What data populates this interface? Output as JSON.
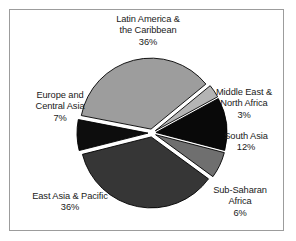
{
  "chart_data": {
    "type": "pie",
    "title": "",
    "subtitle": "",
    "xlabel": "",
    "ylabel": "",
    "legend_position": "none",
    "grid": false,
    "exploded": true,
    "value_unit": "%",
    "total": 100,
    "center": {
      "x": 152,
      "y": 133
    },
    "radius": 71,
    "explode_offset": 4,
    "slices": [
      {
        "label": "Latin America &\nthe Caribbean",
        "label_line1": "Latin America &",
        "label_line2": "the Caribbean",
        "value": 36,
        "value_text": "36%",
        "color": "#9d9d9d",
        "start_angle": 281,
        "end_angle": 410.6
      },
      {
        "label": "Middle East &\nNorth Africa",
        "label_line1": "Middle East &",
        "label_line2": "North Africa",
        "value": 3,
        "value_text": "3%",
        "color": "#b4b4b4",
        "start_angle": 410.6,
        "end_angle": 421.4
      },
      {
        "label": "South Asia",
        "label_line1": "South Asia",
        "label_line2": "",
        "value": 12,
        "value_text": "12%",
        "color": "#090909",
        "start_angle": 421.4,
        "end_angle": 464.6
      },
      {
        "label": "Sub-Saharan\nAfrica",
        "label_line1": "Sub-Saharan",
        "label_line2": "Africa",
        "value": 6,
        "value_text": "6%",
        "color": "#6f6f6f",
        "start_angle": 464.6,
        "end_angle": 486.2
      },
      {
        "label": "East Asia & Pacific",
        "label_line1": "East Asia & Pacific",
        "label_line2": "",
        "value": 36,
        "value_text": "36%",
        "color": "#363636",
        "start_angle": 486.2,
        "end_angle": 615.8
      },
      {
        "label": "Europe and\nCentral Asia",
        "label_line1": "Europe and",
        "label_line2": "Central Asia",
        "value": 7,
        "value_text": "7%",
        "color": "#0d0d0d",
        "start_angle": 615.8,
        "end_angle": 641
      }
    ],
    "colors": {
      "background": "#ffffff",
      "frame_border": "#9c9c9c",
      "slice_outline": "#000000",
      "label_text": "#1a1a1a",
      "gap": "#ffffff"
    }
  }
}
